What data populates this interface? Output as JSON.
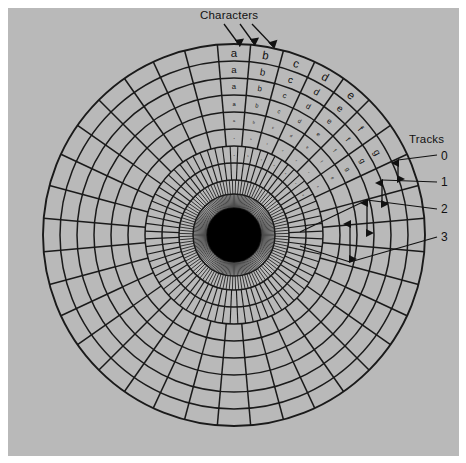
{
  "figure": {
    "title_top": "Characters",
    "title_right": "Tracks",
    "background_color": "#b9b9b9",
    "page_color": "#ffffff",
    "line_color": "#1a1a1a",
    "hub_color": "#000000",
    "text_color": "#111111"
  },
  "chart_data": {
    "type": "diagram",
    "subtype": "polar-disk-sector-map",
    "center": {
      "x": 234,
      "y": 235
    },
    "outer_radius": 191,
    "hub_radius": 27,
    "ring_count": 11,
    "ring_radii": [
      191,
      174,
      157,
      140,
      123,
      106,
      89,
      72,
      55,
      41,
      27
    ],
    "sector_count": 36,
    "labels": {
      "characters": "Characters",
      "tracks": "Tracks"
    },
    "character_letters": [
      "a",
      "b",
      "c",
      "d",
      "e",
      "f",
      "g"
    ],
    "character_rings": [
      {
        "ring": 0,
        "letters": [
          "a",
          "b",
          "c",
          "d",
          "e"
        ]
      },
      {
        "ring": 1,
        "letters": [
          "a",
          "b",
          "c",
          "d",
          "e",
          "f",
          "g"
        ]
      },
      {
        "ring": 2,
        "letters": [
          "a",
          "b",
          "c",
          "d",
          "e",
          "f",
          "g"
        ]
      },
      {
        "ring": 3,
        "letters": [
          "a",
          "b",
          "c",
          "d",
          "e",
          "f",
          "g"
        ]
      },
      {
        "ring": 4,
        "letters": [
          "a",
          "b",
          "c",
          "d",
          "e",
          "f",
          "g"
        ]
      },
      {
        "ring": 5,
        "letters": [
          "a",
          "b",
          "c",
          "d",
          "e",
          "f",
          "g"
        ]
      },
      {
        "ring": 6,
        "letters": [
          "a",
          "b",
          "c",
          "d",
          "e",
          "f",
          "g"
        ]
      }
    ],
    "track_labels": [
      "0",
      "1",
      "2",
      "3"
    ],
    "character_pointer_count": 3,
    "track_marker_count": 4,
    "legend": "",
    "grid": true,
    "xlabel": "",
    "ylabel": ""
  },
  "track_items": [
    {
      "label": "0",
      "label_x": 441,
      "label_y": 156
    },
    {
      "label": "1",
      "label_x": 441,
      "model_note": "",
      "label_y": 182
    },
    {
      "label": "2",
      "label_x": 441,
      "label_y": 209
    },
    {
      "label": "3",
      "label_x": 441,
      "label_y": 237
    }
  ]
}
